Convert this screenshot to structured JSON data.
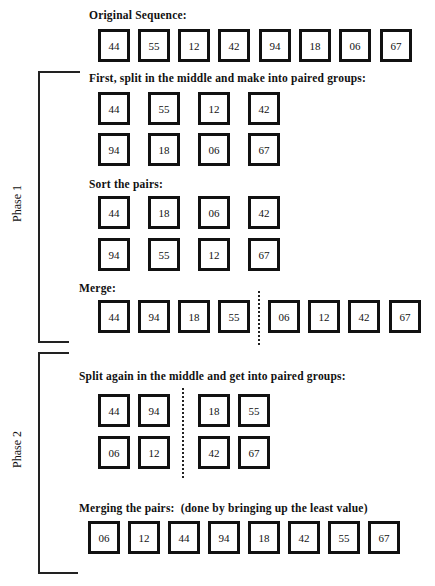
{
  "original": {
    "heading": "Original Sequence:",
    "values": [
      "44",
      "55",
      "12",
      "42",
      "94",
      "18",
      "06",
      "67"
    ]
  },
  "phase1": {
    "label": "Phase 1",
    "split": {
      "heading": "First, split in the middle and make into paired groups:",
      "row1": [
        "44",
        "55",
        "12",
        "42"
      ],
      "row2": [
        "94",
        "18",
        "06",
        "67"
      ]
    },
    "sort": {
      "heading": "Sort the pairs:",
      "row1": [
        "44",
        "18",
        "06",
        "42"
      ],
      "row2": [
        "94",
        "55",
        "12",
        "67"
      ]
    },
    "merge": {
      "heading": "Merge:",
      "left": [
        "44",
        "94",
        "18",
        "55"
      ],
      "right": [
        "06",
        "12",
        "42",
        "67"
      ]
    }
  },
  "phase2": {
    "label": "Phase 2",
    "split": {
      "heading": "Split again in the middle and get into paired groups:",
      "left_row1": [
        "44",
        "94"
      ],
      "left_row2": [
        "06",
        "12"
      ],
      "right_row1": [
        "18",
        "55"
      ],
      "right_row2": [
        "42",
        "67"
      ]
    },
    "merge": {
      "heading": "Merging the pairs:  (done by bringing up the least value)",
      "values": [
        "06",
        "12",
        "44",
        "94",
        "18",
        "42",
        "55",
        "67"
      ]
    }
  }
}
